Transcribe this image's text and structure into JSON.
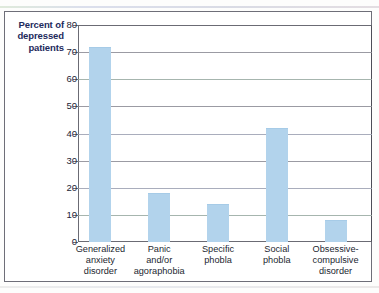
{
  "chart_data": {
    "type": "bar",
    "title": "",
    "subtitle": "",
    "xlabel": "",
    "ylabel": "Percent of depressed patients",
    "ylabel_lines": [
      "Percent of",
      "depressed",
      "patients"
    ],
    "categories": [
      "Generalized anxiety disorder",
      "Panic and/or agoraphobia",
      "Specific phobla",
      "Social phobla",
      "Obsessive-compulsive disorder"
    ],
    "category_lines": [
      [
        "Generalized",
        "anxiety",
        "disorder"
      ],
      [
        "Panic",
        "and/or",
        "agoraphobia"
      ],
      [
        "Specific",
        "phobla"
      ],
      [
        "Social",
        "phobla"
      ],
      [
        "Obsessive-",
        "compulsive",
        "disorder"
      ]
    ],
    "values": [
      72,
      18,
      14,
      42,
      8
    ],
    "ylim": [
      0,
      80
    ],
    "ytick_values": [
      0,
      10,
      20,
      30,
      40,
      50,
      60,
      70,
      80
    ],
    "ytick_labels": [
      "0",
      "10",
      "20",
      "30",
      "40",
      "50",
      "60",
      "70",
      "80"
    ],
    "grid": true,
    "grid_axis": "y",
    "legend": "none",
    "bar_color": "#b2d3ec",
    "axis_title_color": "#1d2a5c",
    "tick_label_color": "#222436",
    "gridline_color": "#8a8a93",
    "plot_border_color": "#6b6b74",
    "annotations": []
  }
}
